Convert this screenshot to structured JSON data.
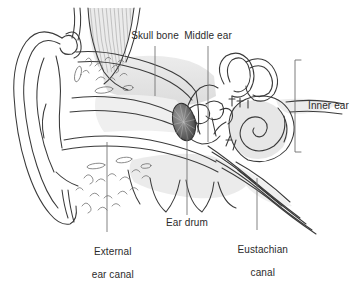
{
  "figure": {
    "background_color": "#ffffff",
    "line_color": "#3a3a3a",
    "fill_light": "#e9e9e9",
    "fill_mid": "#d6d6d6",
    "fill_dark": "#8f8f8f",
    "text_color": "#2b2b2b",
    "leader_color": "#6e6e6e"
  },
  "labels": {
    "skull_bone": "Skull bone",
    "middle_ear": "Middle ear",
    "inner_ear": "Inner ear",
    "ear_drum": "Ear drum",
    "external_ear_canal_line1": "External",
    "external_ear_canal_line2": "ear canal",
    "eustachian_canal_line1": "Eustachian",
    "eustachian_canal_line2": "canal"
  },
  "parts": [
    {
      "id": "pinna",
      "name": "Pinna (auricle)"
    },
    {
      "id": "external-ear-canal",
      "name": "External ear canal"
    },
    {
      "id": "ear-drum",
      "name": "Ear drum (tympanic membrane)"
    },
    {
      "id": "ossicles",
      "name": "Ossicles"
    },
    {
      "id": "semicircular-canals",
      "name": "Semicircular canals"
    },
    {
      "id": "cochlea",
      "name": "Cochlea"
    },
    {
      "id": "eustachian-canal",
      "name": "Eustachian canal"
    },
    {
      "id": "skull-bone",
      "name": "Skull bone"
    },
    {
      "id": "mastoid-cells",
      "name": "Mastoid cells"
    }
  ],
  "annotations": {
    "inner_ear_bracket": {
      "x": 295,
      "y_top": 60,
      "y_bottom": 152
    },
    "leaders": [
      {
        "for": "skull_bone",
        "x": 155,
        "y_top": 46,
        "y_bottom": 96
      },
      {
        "for": "middle_ear",
        "x": 208,
        "y_top": 46,
        "y_bottom": 142
      },
      {
        "for": "ear_drum",
        "x": 187,
        "y_top": 132,
        "y_bottom": 215
      },
      {
        "for": "external_ear_canal",
        "x": 107,
        "y_top": 142,
        "y_bottom": 232
      },
      {
        "for": "eustachian_canal",
        "x": 257,
        "y_top": 178,
        "y_bottom": 230
      }
    ]
  }
}
